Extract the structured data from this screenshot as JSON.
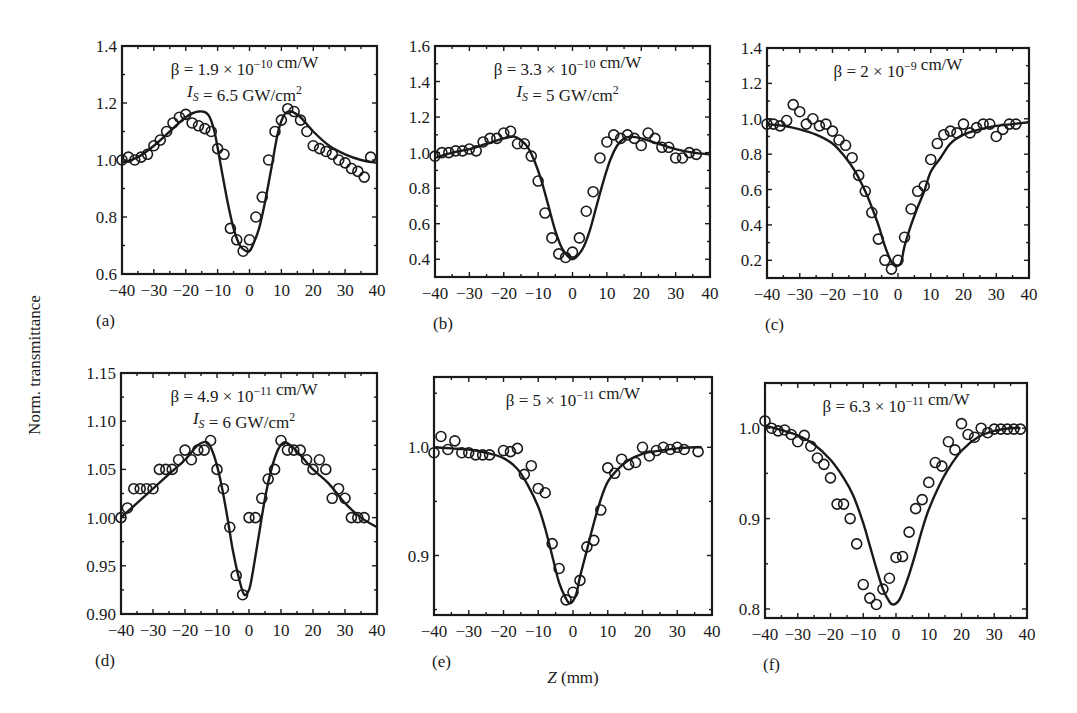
{
  "figure": {
    "ylabel": "Norm. transmittance",
    "xlabel_var": "Z",
    "xlabel_unit": " (mm)"
  },
  "chart_data": [
    {
      "panel": "(a)",
      "type": "scatter",
      "annotation": [
        "β = 1.9 × 10^−10 cm/W",
        "I_S = 6.5 GW/cm^2"
      ],
      "xlim": [
        -40,
        40
      ],
      "ylim": [
        0.6,
        1.4
      ],
      "xticks": [
        -40,
        -30,
        -20,
        -10,
        0,
        10,
        20,
        30,
        40
      ],
      "yticks": [
        0.6,
        0.8,
        1.0,
        1.2,
        1.4
      ],
      "ytick_labels": [
        "0.6",
        "0.8",
        "1.0",
        "1.2",
        "1.4"
      ],
      "box": [
        122,
        46,
        377,
        274
      ],
      "series": [
        {
          "name": "experiment",
          "style": "open-circle",
          "x": [
            -40,
            -38,
            -36,
            -34,
            -32,
            -30,
            -28,
            -26,
            -24,
            -22,
            -20,
            -18,
            -16,
            -14,
            -12,
            -10,
            -8,
            -6,
            -4,
            -2,
            0,
            2,
            4,
            6,
            8,
            10,
            12,
            14,
            16,
            18,
            20,
            22,
            24,
            26,
            28,
            30,
            32,
            34,
            36,
            38
          ],
          "y": [
            1.0,
            1.01,
            1.0,
            1.01,
            1.02,
            1.05,
            1.07,
            1.1,
            1.13,
            1.15,
            1.16,
            1.13,
            1.12,
            1.11,
            1.1,
            1.04,
            1.02,
            0.76,
            0.72,
            0.68,
            0.72,
            0.8,
            0.87,
            1.0,
            1.1,
            1.14,
            1.18,
            1.17,
            1.14,
            1.1,
            1.05,
            1.04,
            1.03,
            1.02,
            1.0,
            0.99,
            0.97,
            0.96,
            0.94,
            1.01
          ]
        },
        {
          "name": "fit",
          "style": "line",
          "x": [
            -40,
            -35,
            -30,
            -25,
            -20,
            -16,
            -13,
            -11,
            -9,
            -7,
            -5,
            -3,
            -1,
            0,
            1,
            3,
            5,
            7,
            9,
            11,
            13,
            16,
            20,
            25,
            30,
            35,
            40
          ],
          "y": [
            0.99,
            1.01,
            1.05,
            1.1,
            1.15,
            1.17,
            1.16,
            1.1,
            0.98,
            0.86,
            0.76,
            0.7,
            0.68,
            0.68,
            0.7,
            0.76,
            0.86,
            0.98,
            1.1,
            1.16,
            1.17,
            1.15,
            1.1,
            1.05,
            1.02,
            1.0,
            0.99
          ]
        }
      ]
    },
    {
      "panel": "(b)",
      "type": "scatter",
      "annotation": [
        "β = 3.3 × 10^−10 cm/W",
        "I_S = 5 GW/cm^2"
      ],
      "xlim": [
        -40,
        40
      ],
      "ylim": [
        0.3,
        1.6
      ],
      "xticks": [
        -40,
        -30,
        -20,
        -10,
        0,
        10,
        20,
        30,
        40
      ],
      "yticks": [
        0.4,
        0.6,
        0.8,
        1.0,
        1.2,
        1.4,
        1.6
      ],
      "ytick_labels": [
        "0.4",
        "0.6",
        "0.8",
        "1.0",
        "1.2",
        "1.4",
        "1.6"
      ],
      "box": [
        435,
        46,
        710,
        277
      ],
      "series": [
        {
          "name": "experiment",
          "style": "open-circle",
          "x": [
            -40,
            -38,
            -36,
            -34,
            -32,
            -30,
            -28,
            -26,
            -24,
            -22,
            -20,
            -18,
            -16,
            -14,
            -12,
            -10,
            -8,
            -6,
            -4,
            -2,
            0,
            2,
            4,
            6,
            8,
            10,
            12,
            14,
            16,
            18,
            20,
            22,
            24,
            26,
            28,
            30,
            32,
            34,
            36
          ],
          "y": [
            0.98,
            1.0,
            1.0,
            1.01,
            1.01,
            1.02,
            1.01,
            1.06,
            1.08,
            1.08,
            1.11,
            1.12,
            1.05,
            1.05,
            0.98,
            0.84,
            0.66,
            0.52,
            0.43,
            0.41,
            0.44,
            0.52,
            0.67,
            0.78,
            0.97,
            1.06,
            1.1,
            1.08,
            1.1,
            1.08,
            1.04,
            1.11,
            1.08,
            1.03,
            1.03,
            0.97,
            0.97,
            1.0,
            0.99
          ]
        },
        {
          "name": "fit",
          "style": "line",
          "x": [
            -40,
            -35,
            -30,
            -25,
            -20,
            -17,
            -15,
            -13,
            -11,
            -9,
            -7,
            -5,
            -3,
            -1,
            0,
            1,
            3,
            5,
            7,
            9,
            11,
            13,
            15,
            17,
            20,
            25,
            30,
            35,
            40
          ],
          "y": [
            0.97,
            1.0,
            1.02,
            1.05,
            1.08,
            1.09,
            1.07,
            1.03,
            0.95,
            0.84,
            0.7,
            0.56,
            0.46,
            0.41,
            0.4,
            0.41,
            0.46,
            0.56,
            0.7,
            0.84,
            0.96,
            1.04,
            1.08,
            1.09,
            1.08,
            1.05,
            1.02,
            1.0,
            0.99
          ]
        }
      ]
    },
    {
      "panel": "(c)",
      "type": "scatter",
      "annotation": [
        "β = 2 × 10^−9 cm/W"
      ],
      "xlim": [
        -40,
        40
      ],
      "ylim": [
        0.1,
        1.4
      ],
      "xticks": [
        -40,
        -30,
        -20,
        -10,
        0,
        10,
        20,
        30,
        40
      ],
      "yticks": [
        0.2,
        0.4,
        0.6,
        0.8,
        1.0,
        1.2,
        1.4
      ],
      "ytick_labels": [
        "0.2",
        "0.4",
        "0.6",
        "0.8",
        "1.0",
        "1.2",
        "1.4"
      ],
      "box": [
        767,
        48,
        1029,
        278
      ],
      "series": [
        {
          "name": "experiment",
          "style": "open-circle",
          "x": [
            -40,
            -38,
            -36,
            -34,
            -32,
            -30,
            -28,
            -26,
            -24,
            -22,
            -20,
            -18,
            -16,
            -14,
            -12,
            -10,
            -8,
            -6,
            -4,
            -2,
            0,
            2,
            4,
            6,
            8,
            10,
            12,
            14,
            16,
            18,
            20,
            22,
            24,
            26,
            28,
            30,
            32,
            34,
            36
          ],
          "y": [
            0.97,
            0.97,
            0.96,
            0.99,
            1.08,
            1.04,
            0.97,
            1.0,
            0.96,
            0.97,
            0.93,
            0.88,
            0.85,
            0.78,
            0.68,
            0.59,
            0.47,
            0.32,
            0.2,
            0.15,
            0.2,
            0.33,
            0.49,
            0.59,
            0.62,
            0.77,
            0.86,
            0.91,
            0.93,
            0.92,
            0.97,
            0.92,
            0.95,
            0.97,
            0.97,
            0.9,
            0.94,
            0.97,
            0.97
          ]
        },
        {
          "name": "fit",
          "style": "line",
          "x": [
            -40,
            -35,
            -30,
            -25,
            -20,
            -16,
            -13,
            -10,
            -8,
            -6,
            -4,
            -2,
            -1,
            0,
            1,
            2,
            4,
            6,
            8,
            10,
            13,
            16,
            20,
            25,
            30,
            35,
            40
          ],
          "y": [
            0.97,
            0.96,
            0.94,
            0.91,
            0.86,
            0.78,
            0.7,
            0.59,
            0.5,
            0.4,
            0.28,
            0.19,
            0.17,
            0.17,
            0.19,
            0.28,
            0.4,
            0.5,
            0.59,
            0.7,
            0.78,
            0.86,
            0.91,
            0.94,
            0.96,
            0.97,
            0.98
          ]
        }
      ]
    },
    {
      "panel": "(d)",
      "type": "scatter",
      "annotation": [
        "β = 4.9 × 10^−11 cm/W",
        "I_S = 6 GW/cm^2"
      ],
      "xlim": [
        -40,
        40
      ],
      "ylim": [
        0.9,
        1.15
      ],
      "xticks": [
        -40,
        -30,
        -20,
        -10,
        0,
        10,
        20,
        30,
        40
      ],
      "yticks": [
        0.9,
        0.95,
        1.0,
        1.05,
        1.1,
        1.15
      ],
      "ytick_labels": [
        "0.90",
        "0.95",
        "1.00",
        "1.05",
        "1.10",
        "1.15"
      ],
      "box": [
        121,
        373,
        377,
        614
      ],
      "series": [
        {
          "name": "experiment",
          "style": "open-circle",
          "x": [
            -40,
            -38,
            -36,
            -34,
            -32,
            -30,
            -28,
            -26,
            -24,
            -22,
            -20,
            -18,
            -16,
            -14,
            -12,
            -10,
            -8,
            -6,
            -4,
            -2,
            0,
            2,
            4,
            6,
            8,
            10,
            12,
            14,
            16,
            18,
            20,
            22,
            24,
            26,
            28,
            30,
            32,
            34,
            36
          ],
          "y": [
            1.0,
            1.01,
            1.03,
            1.03,
            1.03,
            1.03,
            1.05,
            1.05,
            1.05,
            1.06,
            1.07,
            1.06,
            1.07,
            1.07,
            1.08,
            1.05,
            1.03,
            0.99,
            0.94,
            0.92,
            1.0,
            1.0,
            1.02,
            1.04,
            1.05,
            1.08,
            1.07,
            1.07,
            1.07,
            1.06,
            1.05,
            1.06,
            1.05,
            1.02,
            1.03,
            1.02,
            1.0,
            1.0,
            1.0
          ]
        },
        {
          "name": "fit",
          "style": "line",
          "x": [
            -40,
            -35,
            -30,
            -25,
            -20,
            -16,
            -13,
            -11,
            -9,
            -7,
            -5,
            -3,
            -1.5,
            0,
            1,
            3,
            5,
            7,
            9,
            11,
            13,
            16,
            20,
            25,
            30,
            35,
            40
          ],
          "y": [
            1.0,
            1.015,
            1.03,
            1.045,
            1.06,
            1.075,
            1.078,
            1.065,
            1.04,
            1.005,
            0.965,
            0.935,
            0.92,
            0.925,
            0.94,
            0.98,
            1.02,
            1.05,
            1.07,
            1.078,
            1.075,
            1.065,
            1.05,
            1.035,
            1.015,
            1.0,
            0.99
          ]
        }
      ]
    },
    {
      "panel": "(e)",
      "type": "scatter",
      "annotation": [
        "β = 5 × 10^−11 cm/W"
      ],
      "xlim": [
        -40,
        40
      ],
      "ylim": [
        0.845,
        1.065
      ],
      "xticks": [
        -40,
        -30,
        -20,
        -10,
        0,
        10,
        20,
        30,
        40
      ],
      "yticks": [
        0.9,
        1.0
      ],
      "ytick_labels": [
        "0.9",
        "1.0"
      ],
      "box": [
        434,
        377,
        712,
        615
      ],
      "series": [
        {
          "name": "experiment",
          "style": "open-circle",
          "x": [
            -40,
            -38,
            -36,
            -34,
            -32,
            -30,
            -28,
            -26,
            -24,
            -20,
            -18,
            -16,
            -14,
            -12,
            -10,
            -8,
            -6,
            -4,
            -2,
            0,
            2,
            4,
            6,
            8,
            10,
            12,
            14,
            16,
            18,
            20,
            22,
            24,
            26,
            28,
            30,
            32,
            36
          ],
          "y": [
            0.995,
            1.01,
            0.998,
            1.006,
            0.995,
            0.995,
            0.993,
            0.993,
            0.993,
            0.997,
            0.996,
            0.999,
            0.975,
            0.983,
            0.962,
            0.958,
            0.911,
            0.888,
            0.859,
            0.866,
            0.877,
            0.908,
            0.914,
            0.942,
            0.981,
            0.976,
            0.989,
            0.984,
            0.986,
            1.0,
            0.992,
            0.997,
            1.0,
            0.998,
            1.0,
            0.998,
            0.996
          ]
        },
        {
          "name": "fit",
          "style": "line",
          "x": [
            -40,
            -35,
            -30,
            -25,
            -20,
            -16,
            -13,
            -10,
            -8,
            -6,
            -4,
            -2,
            -1,
            0,
            1,
            2,
            4,
            6,
            8,
            10,
            13,
            16,
            20,
            25,
            30,
            35,
            37
          ],
          "y": [
            1.0,
            0.999,
            0.998,
            0.995,
            0.99,
            0.98,
            0.965,
            0.945,
            0.925,
            0.9,
            0.875,
            0.86,
            0.856,
            0.858,
            0.865,
            0.88,
            0.905,
            0.93,
            0.952,
            0.968,
            0.98,
            0.988,
            0.994,
            0.997,
            0.999,
            1.0,
            1.0
          ]
        }
      ]
    },
    {
      "panel": "(f)",
      "type": "scatter",
      "annotation": [
        "β = 6.3 × 10^−11 cm/W"
      ],
      "xlim": [
        -40,
        40
      ],
      "ylim": [
        0.79,
        1.05
      ],
      "xticks": [
        -40,
        -30,
        -20,
        -10,
        0,
        10,
        20,
        30,
        40
      ],
      "yticks": [
        0.8,
        0.9,
        1.0
      ],
      "ytick_labels": [
        "0.8",
        "0.9",
        "1.0"
      ],
      "box": [
        765,
        383,
        1027,
        618
      ],
      "series": [
        {
          "name": "experiment",
          "style": "open-circle",
          "x": [
            -40,
            -38,
            -36,
            -34,
            -32,
            -30,
            -28,
            -26,
            -24,
            -22,
            -20,
            -18,
            -16,
            -14,
            -12,
            -10,
            -8,
            -6,
            -4,
            -2,
            0,
            2,
            4,
            6,
            8,
            10,
            12,
            14,
            16,
            18,
            20,
            22,
            24,
            26,
            28,
            30,
            32,
            34,
            36,
            38
          ],
          "y": [
            1.008,
            1.0,
            0.997,
            0.998,
            0.993,
            0.985,
            0.992,
            0.98,
            0.967,
            0.96,
            0.945,
            0.916,
            0.916,
            0.9,
            0.872,
            0.827,
            0.812,
            0.805,
            0.822,
            0.834,
            0.857,
            0.858,
            0.885,
            0.911,
            0.921,
            0.94,
            0.962,
            0.958,
            0.985,
            0.976,
            1.005,
            0.993,
            0.99,
            1.0,
            0.995,
            0.999,
            0.999,
            0.999,
            0.999,
            0.999
          ]
        },
        {
          "name": "fit",
          "style": "line",
          "x": [
            -40,
            -35,
            -30,
            -25,
            -20,
            -16,
            -13,
            -10,
            -8,
            -6,
            -4,
            -2,
            -1,
            0,
            1,
            2,
            4,
            6,
            8,
            10,
            13,
            16,
            20,
            25,
            30,
            35,
            38
          ],
          "y": [
            1.003,
            0.998,
            0.992,
            0.982,
            0.965,
            0.945,
            0.925,
            0.895,
            0.87,
            0.845,
            0.822,
            0.808,
            0.805,
            0.806,
            0.81,
            0.818,
            0.838,
            0.862,
            0.888,
            0.91,
            0.935,
            0.955,
            0.975,
            0.99,
            0.997,
            1.0,
            1.0
          ]
        }
      ]
    }
  ]
}
